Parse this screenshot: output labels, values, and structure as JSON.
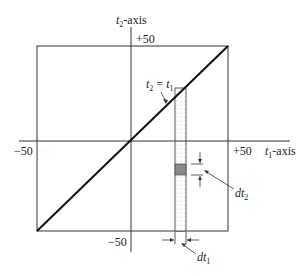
{
  "diagram": {
    "axes": {
      "x_label_var": "t",
      "x_label_sub": "1",
      "x_label_suffix": "-axis",
      "y_label_var": "t",
      "y_label_sub": "2",
      "y_label_suffix": "-axis"
    },
    "ticks": {
      "x_neg": "−50",
      "x_pos": "+50",
      "y_pos": "+50",
      "y_neg": "−50"
    },
    "line_label": {
      "lhs_var": "t",
      "lhs_sub": "2",
      "eq": " = ",
      "rhs_var": "t",
      "rhs_sub": "1"
    },
    "dt2_label": {
      "var": "dt",
      "sub": "2"
    },
    "dt1_label": {
      "var": "dt",
      "sub": "1"
    },
    "colors": {
      "line": "#111111",
      "box": "#333333",
      "shade": "#8a8a8a",
      "strip_dots": "#bbbbbb"
    }
  }
}
